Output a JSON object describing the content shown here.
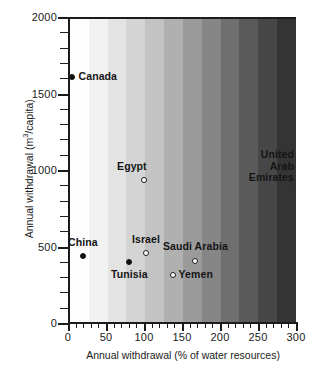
{
  "chart_data": {
    "type": "scatter",
    "title": "",
    "xlabel": "Annual  withdrawal  (% of water resources)",
    "ylabel": "Annual  withdrawal  (m3/capita)",
    "ylabel_prefix": "Annual  withdrawal  (m",
    "ylabel_sup": "3",
    "ylabel_suffix": "/capita)",
    "xlim": [
      0,
      300
    ],
    "ylim": [
      0,
      2000
    ],
    "x_major_ticks": [
      0,
      50,
      100,
      150,
      200,
      250,
      300
    ],
    "x_major_tick_labels": [
      "0",
      "50",
      "100",
      "150",
      "200",
      "250",
      "300"
    ],
    "x_minor_tick_step": 10,
    "y_major_ticks": [
      0,
      500,
      1000,
      1500,
      2000
    ],
    "y_major_tick_labels": [
      "0",
      "500",
      "1000",
      "1500",
      "2000"
    ],
    "y_minor_tick_step": 100,
    "grid": false,
    "legend": "none",
    "background": "stepped horizontal grayscale gradient, light at left to dark at right",
    "background_bands": [
      "#fdfdfd",
      "#f2f2f2",
      "#e3e3e3",
      "#d4d4d4",
      "#c3c3c3",
      "#b0b0b0",
      "#9b9b9b",
      "#868686",
      "#6f6f6f",
      "#5a5a5a",
      "#474747",
      "#343434"
    ],
    "points": [
      {
        "label": "Canada",
        "x": 2,
        "y": 1620,
        "marker": "filled",
        "label_anchor": "left",
        "label_dx": 7,
        "label_dy": 0
      },
      {
        "label": "Egypt",
        "x": 97,
        "y": 950,
        "marker": "open",
        "label_anchor": "right",
        "label_dx": 3,
        "label_dy": -13
      },
      {
        "label": "United\nArab\nEmirates",
        "x": 300,
        "y": 880,
        "marker": "open",
        "label_anchor": "right",
        "label_dx": -4,
        "label_dy": -24
      },
      {
        "label": "China",
        "x": 17,
        "y": 450,
        "marker": "open_none_filled",
        "label_anchor": "center",
        "label_dx": 0,
        "label_dy": -13
      },
      {
        "label": "Israel",
        "x": 100,
        "y": 470,
        "marker": "open",
        "label_anchor": "center",
        "label_dx": 0,
        "label_dy": -13
      },
      {
        "label": "Tunisia",
        "x": 78,
        "y": 410,
        "marker": "filled",
        "label_anchor": "center",
        "label_dx": 0,
        "label_dy": 13
      },
      {
        "label": "Saudi Arabia",
        "x": 165,
        "y": 420,
        "marker": "open",
        "label_anchor": "center",
        "label_dx": 0,
        "label_dy": -14
      },
      {
        "label": "Yemen",
        "x": 135,
        "y": 330,
        "marker": "open",
        "label_anchor": "left",
        "label_dx": 6,
        "label_dy": 0
      }
    ],
    "marker_styles": {
      "Canada": "filled",
      "Egypt": "open",
      "United Arab Emirates": "open",
      "China": "filled",
      "Israel": "open",
      "Tunisia": "filled",
      "Saudi Arabia": "open",
      "Yemen": "open"
    },
    "colors": {
      "axis": "#1b1b1b",
      "text": "#141414",
      "marker_filled": "#111111",
      "marker_open_fill": "#ffffff",
      "marker_open_stroke": "#1b1b1b"
    }
  }
}
